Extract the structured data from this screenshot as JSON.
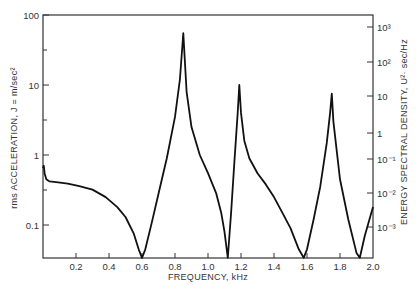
{
  "chart_data": {
    "type": "line",
    "title": "",
    "xlabel": "FREQUENCY, kHz",
    "ylabel": "rms ACCELERATION, J = m/sec²",
    "ylabel_right": "ENERGY SPECTRAL DENSITY, U²·sec/Hz",
    "xlim": [
      0,
      2.0
    ],
    "ylim": [
      0.034,
      100
    ],
    "yscale": "log",
    "grid": false,
    "x_ticks": [
      "0.2",
      "0.4",
      "0.6",
      "0.8",
      "1.0",
      "1.2",
      "1.4",
      "1.6",
      "1.8",
      "2.0"
    ],
    "y_ticks_left": [
      "100",
      "10",
      "1",
      "0.1"
    ],
    "y_ticks_right": [
      "10³",
      "10²",
      "10",
      "1",
      "10⁻¹",
      "10⁻²",
      "10⁻³"
    ],
    "series": [
      {
        "name": "rms acceleration",
        "x": [
          0.0,
          0.005,
          0.01,
          0.02,
          0.04,
          0.08,
          0.15,
          0.22,
          0.3,
          0.38,
          0.45,
          0.5,
          0.55,
          0.58,
          0.6,
          0.62,
          0.66,
          0.7,
          0.75,
          0.8,
          0.83,
          0.85,
          0.87,
          0.9,
          0.95,
          1.0,
          1.05,
          1.08,
          1.1,
          1.12,
          1.14,
          1.16,
          1.18,
          1.19,
          1.2,
          1.22,
          1.25,
          1.3,
          1.35,
          1.4,
          1.45,
          1.5,
          1.55,
          1.58,
          1.6,
          1.64,
          1.68,
          1.72,
          1.74,
          1.75,
          1.76,
          1.8,
          1.85,
          1.9,
          1.92,
          1.95,
          2.0
        ],
        "values": [
          0.65,
          0.7,
          0.55,
          0.45,
          0.42,
          0.41,
          0.39,
          0.36,
          0.32,
          0.25,
          0.18,
          0.13,
          0.075,
          0.045,
          0.034,
          0.045,
          0.11,
          0.28,
          0.9,
          3.5,
          12,
          55,
          8,
          2.5,
          1.0,
          0.55,
          0.28,
          0.15,
          0.08,
          0.034,
          0.15,
          0.8,
          4,
          10,
          4,
          1.6,
          0.9,
          0.55,
          0.38,
          0.25,
          0.15,
          0.09,
          0.045,
          0.034,
          0.045,
          0.12,
          0.35,
          1.5,
          4,
          7.5,
          3,
          0.45,
          0.12,
          0.04,
          0.034,
          0.07,
          0.18
        ]
      }
    ]
  },
  "labels": {
    "xlabel": "FREQUENCY, kHz",
    "ylabel_left": "rms ACCELERATION, J = m/sec²",
    "ylabel_right": "ENERGY SPECTRAL DENSITY, U²· sec/Hz"
  }
}
